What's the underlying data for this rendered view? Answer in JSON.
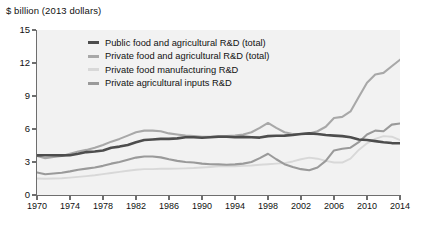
{
  "axis_title": "$ billion (2013 dollars)",
  "legend": [
    {
      "label": "Public food and agricultural R&D (total)",
      "color": "#4d4d4d"
    },
    {
      "label": "Private food and agricultural R&D (total)",
      "color": "#a8a8a8"
    },
    {
      "label": "Private food manufacturing R&D",
      "color": "#d8d8d8"
    },
    {
      "label": "Private agricultural inputs R&D",
      "color": "#9a9a9a"
    }
  ],
  "chart_data": {
    "type": "line",
    "title": "",
    "subtitle": "",
    "xlabel": "",
    "ylabel": "$ billion (2013 dollars)",
    "xlim": [
      1970,
      2014
    ],
    "ylim": [
      0,
      15
    ],
    "yticks": [
      0,
      3,
      6,
      9,
      12,
      15
    ],
    "xticks": [
      1970,
      1974,
      1978,
      1982,
      1986,
      1990,
      1994,
      1998,
      2002,
      2006,
      2010,
      2014
    ],
    "grid": false,
    "legend_position": "upper-center",
    "x": [
      1970,
      1971,
      1972,
      1973,
      1974,
      1975,
      1976,
      1977,
      1978,
      1979,
      1980,
      1981,
      1982,
      1983,
      1984,
      1985,
      1986,
      1987,
      1988,
      1989,
      1990,
      1991,
      1992,
      1993,
      1994,
      1995,
      1996,
      1997,
      1998,
      1999,
      2000,
      2001,
      2002,
      2003,
      2004,
      2005,
      2006,
      2007,
      2008,
      2009,
      2010,
      2011,
      2012,
      2013,
      2014
    ],
    "series": [
      {
        "name": "Public food and agricultural R&D (total)",
        "color": "#4d4d4d",
        "width": 2.6,
        "values": [
          3.6,
          3.62,
          3.62,
          3.6,
          3.62,
          3.75,
          3.9,
          3.95,
          4.05,
          4.3,
          4.4,
          4.55,
          4.8,
          5.0,
          5.05,
          5.1,
          5.1,
          5.15,
          5.25,
          5.25,
          5.2,
          5.25,
          5.3,
          5.3,
          5.25,
          5.28,
          5.25,
          5.22,
          5.35,
          5.38,
          5.4,
          5.45,
          5.55,
          5.6,
          5.55,
          5.45,
          5.4,
          5.35,
          5.25,
          5.05,
          5.0,
          4.9,
          4.8,
          4.72,
          4.7
        ]
      },
      {
        "name": "Private food and agricultural R&D (total)",
        "color": "#a8a8a8",
        "width": 2.1,
        "values": [
          3.55,
          3.35,
          3.45,
          3.55,
          3.75,
          3.95,
          4.1,
          4.3,
          4.55,
          4.85,
          5.1,
          5.4,
          5.7,
          5.85,
          5.85,
          5.8,
          5.6,
          5.5,
          5.4,
          5.35,
          5.3,
          5.3,
          5.35,
          5.35,
          5.4,
          5.5,
          5.7,
          6.1,
          6.55,
          6.1,
          5.7,
          5.55,
          5.55,
          5.6,
          5.8,
          6.2,
          7.0,
          7.1,
          7.6,
          8.9,
          10.2,
          10.95,
          11.1,
          11.7,
          12.3
        ]
      },
      {
        "name": "Private food manufacturing R&D",
        "color": "#d8d8d8",
        "width": 1.9,
        "values": [
          1.5,
          1.48,
          1.5,
          1.52,
          1.58,
          1.65,
          1.72,
          1.8,
          1.9,
          2.0,
          2.1,
          2.2,
          2.3,
          2.35,
          2.35,
          2.38,
          2.38,
          2.4,
          2.42,
          2.45,
          2.5,
          2.55,
          2.6,
          2.62,
          2.62,
          2.65,
          2.68,
          2.75,
          2.8,
          2.85,
          2.9,
          3.05,
          3.25,
          3.4,
          3.3,
          3.1,
          2.95,
          2.95,
          3.3,
          4.1,
          4.7,
          5.1,
          5.35,
          5.3,
          5.0
        ]
      },
      {
        "name": "Private agricultural inputs R&D",
        "color": "#9a9a9a",
        "width": 2.1,
        "values": [
          2.05,
          1.88,
          1.95,
          2.02,
          2.15,
          2.3,
          2.4,
          2.5,
          2.65,
          2.85,
          3.0,
          3.2,
          3.4,
          3.5,
          3.5,
          3.42,
          3.25,
          3.1,
          3.0,
          2.95,
          2.85,
          2.8,
          2.78,
          2.75,
          2.78,
          2.85,
          3.0,
          3.35,
          3.75,
          3.25,
          2.8,
          2.55,
          2.35,
          2.25,
          2.5,
          3.1,
          4.05,
          4.2,
          4.3,
          4.8,
          5.5,
          5.85,
          5.8,
          6.4,
          6.5
        ]
      }
    ]
  }
}
